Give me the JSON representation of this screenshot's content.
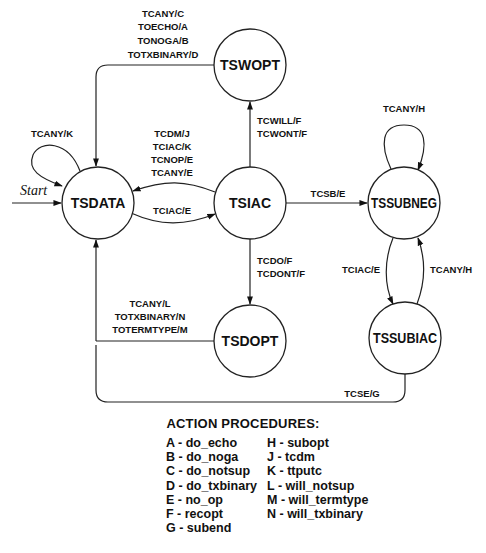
{
  "diagram": {
    "start_label": "Start",
    "states": [
      {
        "id": "TSDATA",
        "label": "TSDATA",
        "cx": 98,
        "cy": 203,
        "r": 36
      },
      {
        "id": "TSWOPT",
        "label": "TSWOPT",
        "cx": 250,
        "cy": 65,
        "r": 36
      },
      {
        "id": "TSIAC",
        "label": "TSIAC",
        "cx": 250,
        "cy": 203,
        "r": 36
      },
      {
        "id": "TSDOPT",
        "label": "TSDOPT",
        "cx": 250,
        "cy": 341,
        "r": 36
      },
      {
        "id": "TSSUBNEG",
        "label": "TSSUBNEG",
        "cx": 404,
        "cy": 203,
        "r": 36
      },
      {
        "id": "TSSUBIAC",
        "label": "TSSUBIAC",
        "cx": 405,
        "cy": 338,
        "r": 36
      }
    ],
    "transitions": [
      {
        "from": "TSWOPT",
        "to": "TSDATA",
        "labels": [
          "TCANY/C",
          "TOECHO/A",
          "TONOGA/B",
          "TOTXBINARY/D"
        ]
      },
      {
        "from": "TSDATA",
        "to": "TSDATA",
        "labels": [
          "TCANY/K"
        ]
      },
      {
        "from": "TSIAC",
        "to": "TSDATA",
        "labels": [
          "TCDM/J",
          "TCIAC/K",
          "TCNOP/E",
          "TCANY/E"
        ]
      },
      {
        "from": "TSDATA",
        "to": "TSIAC",
        "labels": [
          "TCIAC/E"
        ]
      },
      {
        "from": "TSIAC",
        "to": "TSWOPT",
        "labels": [
          "TCWILL/F",
          "TCWONT/F"
        ]
      },
      {
        "from": "TSIAC",
        "to": "TSDOPT",
        "labels": [
          "TCDO/F",
          "TCDONT/F"
        ]
      },
      {
        "from": "TSDOPT",
        "to": "TSDATA",
        "labels": [
          "TCANY/L",
          "TOTXBINARY/N",
          "TOTERMTYPE/M"
        ]
      },
      {
        "from": "TSIAC",
        "to": "TSSUBNEG",
        "labels": [
          "TCSB/E"
        ]
      },
      {
        "from": "TSSUBNEG",
        "to": "TSSUBNEG",
        "labels": [
          "TCANY/H"
        ]
      },
      {
        "from": "TSSUBNEG",
        "to": "TSSUBIAC",
        "labels": [
          "TCIAC/E"
        ]
      },
      {
        "from": "TSSUBIAC",
        "to": "TSSUBNEG",
        "labels": [
          "TCANY/H"
        ]
      },
      {
        "from": "TSSUBIAC",
        "to": "TSDATA",
        "labels": [
          "TCSE/G"
        ]
      }
    ]
  },
  "legend": {
    "title": "ACTION PROCEDURES:",
    "col1": [
      "A - do_echo",
      "B - do_noga",
      "C - do_notsup",
      "D - do_txbinary",
      "E - no_op",
      "F - recopt",
      "G - subend"
    ],
    "col2": [
      "H - subopt",
      "J - tcdm",
      "K - ttputc",
      "L - will_notsup",
      "M - will_termtype",
      "N - will_txbinary"
    ]
  }
}
